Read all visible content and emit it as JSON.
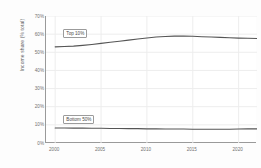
{
  "chart_data": {
    "type": "line",
    "title": "",
    "xlabel": "",
    "ylabel": "Income share (% total)",
    "xlim": [
      1999,
      2022
    ],
    "ylim": [
      0,
      70
    ],
    "grid": true,
    "legend_position": "inline-annotations",
    "x": [
      2000,
      2001,
      2002,
      2003,
      2004,
      2005,
      2006,
      2007,
      2008,
      2009,
      2010,
      2011,
      2012,
      2013,
      2014,
      2015,
      2016,
      2017,
      2018,
      2019,
      2020,
      2021,
      2022
    ],
    "series": [
      {
        "name": "Top 10%",
        "color": "#555555",
        "values": [
          53.0,
          53.2,
          53.4,
          53.8,
          54.3,
          54.9,
          55.5,
          56.1,
          56.7,
          57.3,
          57.9,
          58.4,
          58.7,
          58.9,
          58.9,
          58.8,
          58.6,
          58.4,
          58.2,
          58.0,
          57.8,
          57.7,
          57.6
        ]
      },
      {
        "name": "Bottom 50%",
        "color": "#555555",
        "values": [
          8.3,
          8.3,
          8.2,
          8.2,
          8.1,
          8.1,
          8.0,
          8.0,
          7.9,
          7.9,
          7.8,
          7.8,
          7.7,
          7.7,
          7.7,
          7.6,
          7.6,
          7.6,
          7.6,
          7.6,
          7.7,
          7.8,
          7.8
        ]
      }
    ],
    "yticks": [
      {
        "value": 70,
        "label": "70%"
      },
      {
        "value": 60,
        "label": "60%"
      },
      {
        "value": 50,
        "label": "50%"
      },
      {
        "value": 40,
        "label": "40%"
      },
      {
        "value": 30,
        "label": "30%"
      },
      {
        "value": 20,
        "label": "20%"
      },
      {
        "value": 10,
        "label": "10%"
      },
      {
        "value": 0,
        "label": "0%"
      }
    ],
    "xticks": [
      {
        "value": 2000,
        "label": "2000"
      },
      {
        "value": 2005,
        "label": "2005"
      },
      {
        "value": 2010,
        "label": "2010"
      },
      {
        "value": 2015,
        "label": "2015"
      },
      {
        "value": 2020,
        "label": "2020"
      }
    ],
    "annotations": [
      {
        "name": "Top 10%",
        "x": 2001.0,
        "y": 60.5
      },
      {
        "name": "Bottom 50%",
        "x": 2001.0,
        "y": 13.0
      }
    ],
    "colors": {
      "line": "#555555",
      "grid": "#ededed",
      "axis": "#9a9a9a",
      "text": "#717171",
      "background": "#ffffff"
    }
  }
}
